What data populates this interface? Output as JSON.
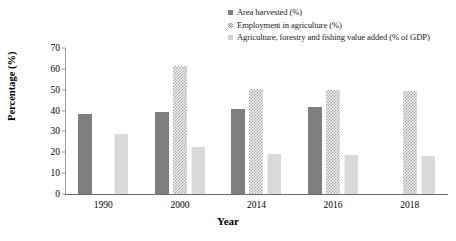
{
  "chart_data": {
    "type": "bar",
    "title": "",
    "xlabel": "Year",
    "ylabel": "Percentage (%)",
    "categories": [
      "1990",
      "2000",
      "2014",
      "2016",
      "2018"
    ],
    "series": [
      {
        "name": "Area harvested (%)",
        "color": "#7f7f7f",
        "pattern": "solid",
        "values": [
          38.5,
          39.5,
          41.0,
          41.5,
          null
        ]
      },
      {
        "name": "Employment in agriculture (%)",
        "color": "#efefef",
        "pattern": "checkered",
        "values": [
          null,
          61.5,
          50.5,
          50.0,
          49.5
        ]
      },
      {
        "name": "Agriculture, forestry and fishing value added (% of GDP)",
        "color": "#d9d9d9",
        "pattern": "fine-vertical-lines",
        "values": [
          29.0,
          22.5,
          19.0,
          18.5,
          18.0
        ]
      }
    ],
    "ylim": [
      0,
      70
    ],
    "yticks": [
      0,
      10,
      20,
      30,
      40,
      50,
      60,
      70
    ],
    "ytick_labels": [
      "0",
      "10",
      "20",
      "30",
      "40",
      "50",
      "60",
      "70"
    ],
    "grid": false,
    "legend_position": "top-right"
  },
  "axes": {
    "y_title": "Percentage (%)",
    "x_title": "Year"
  },
  "legend": {
    "items": [
      {
        "label": "Area harvested (%)",
        "swatch": "series0-swatch"
      },
      {
        "label": "Employment in agriculture (%)",
        "swatch": "series1-swatch"
      },
      {
        "label": "Agriculture, forestry and fishing value added (% of GDP)",
        "swatch": "series2-swatch"
      }
    ]
  }
}
